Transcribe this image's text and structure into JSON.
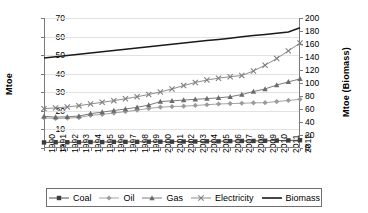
{
  "chart_data": {
    "type": "line",
    "title": "",
    "xlabel": "",
    "ylabel": "Mtoe",
    "y2label": "Mtoe (Biomass)",
    "ylim": [
      0,
      70
    ],
    "y2lim": [
      0,
      200
    ],
    "yticks": [
      0,
      10,
      20,
      30,
      40,
      50,
      60,
      70
    ],
    "y2ticks": [
      0,
      20,
      40,
      60,
      80,
      100,
      120,
      140,
      160,
      180,
      200
    ],
    "grid": true,
    "legend_position": "bottom",
    "categories": [
      "1990",
      "1991",
      "1992",
      "1993",
      "1994",
      "1995",
      "1996",
      "1997",
      "1998",
      "1999",
      "2000",
      "2001",
      "2002",
      "2003",
      "2004",
      "2005",
      "2006",
      "2007",
      "2008",
      "2009",
      "2010",
      "2011",
      "2012"
    ],
    "series": [
      {
        "name": "Coal",
        "axis": "left",
        "marker": "square",
        "color": "#3d3d3d",
        "values": [
          3.0,
          3.1,
          3.1,
          3.1,
          3.2,
          3.2,
          3.3,
          3.3,
          3.3,
          3.4,
          3.4,
          3.4,
          3.5,
          3.5,
          3.6,
          3.6,
          3.7,
          3.8,
          3.8,
          3.9,
          4.0,
          4.1,
          4.2
        ]
      },
      {
        "name": "Oil",
        "axis": "left",
        "marker": "diamond",
        "color": "#9a9a9a",
        "values": [
          16.2,
          15.9,
          16.1,
          16.4,
          17.6,
          18.1,
          18.8,
          19.6,
          20.4,
          21.3,
          22.0,
          22.3,
          22.5,
          22.9,
          23.3,
          23.7,
          23.9,
          24.1,
          24.3,
          24.4,
          25.0,
          25.6,
          26.2
        ]
      },
      {
        "name": "Gas",
        "axis": "left",
        "marker": "triangle",
        "color": "#6b6b6b",
        "values": [
          17.1,
          16.6,
          16.8,
          17.2,
          18.5,
          19.3,
          20.2,
          21.0,
          21.9,
          23.1,
          25.0,
          25.4,
          25.8,
          26.2,
          26.6,
          27.0,
          27.6,
          28.8,
          30.4,
          31.8,
          33.9,
          35.6,
          37.2
        ]
      },
      {
        "name": "Electricity",
        "axis": "left",
        "marker": "cross",
        "color": "#808080",
        "values": [
          21.2,
          21.6,
          22.1,
          22.8,
          23.7,
          24.6,
          25.5,
          26.5,
          27.6,
          28.8,
          30.2,
          31.8,
          33.6,
          35.3,
          36.6,
          37.6,
          38.4,
          39.0,
          41.5,
          44.6,
          48.2,
          52.3,
          56.5
        ]
      },
      {
        "name": "Biomass",
        "axis": "right",
        "marker": "none",
        "color": "#1a1a1a",
        "values": [
          138.5,
          140.4,
          142.3,
          144.2,
          146.1,
          148.0,
          150.0,
          151.9,
          153.8,
          155.7,
          157.6,
          159.5,
          161.4,
          163.3,
          165.2,
          167.1,
          169.0,
          171.0,
          172.9,
          174.8,
          176.7,
          178.6,
          185.0
        ]
      }
    ]
  },
  "legend": {
    "items": [
      {
        "label": "Coal",
        "marker": "square"
      },
      {
        "label": "Oil",
        "marker": "diamond"
      },
      {
        "label": "Gas",
        "marker": "triangle"
      },
      {
        "label": "Electricity",
        "marker": "cross"
      },
      {
        "label": "Biomass",
        "marker": "none"
      }
    ]
  }
}
